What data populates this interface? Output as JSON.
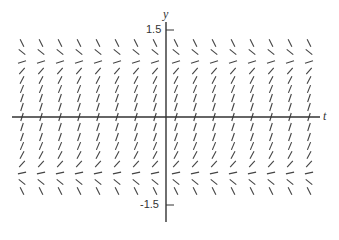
{
  "chart_data": {
    "type": "slope-field",
    "title": "",
    "equation_inferred": "dy/dt = 1 - y^2",
    "xlabel": "t",
    "ylabel": "y",
    "y_tick_labels": [
      "1.5",
      "-1.5"
    ],
    "y_ticks": [
      1.5,
      -1.5
    ],
    "ylim": [
      -1.7,
      1.7
    ],
    "grid": false,
    "equilibria": [
      -1,
      1
    ],
    "columns_px": [
      22,
      41,
      60,
      79,
      98,
      117,
      136,
      155,
      176,
      195,
      214,
      233,
      252,
      271,
      290,
      309
    ],
    "rows_px": [
      43,
      52,
      62,
      71,
      80,
      89,
      98,
      107,
      127,
      137,
      146,
      155,
      164,
      173,
      182,
      191
    ]
  },
  "labels": {
    "y_axis": "y",
    "t_axis": "t",
    "y_top": "1.5",
    "y_bottom": "-1.5"
  },
  "style": {
    "axis_color": "#333333",
    "segment_color": "#444444"
  }
}
